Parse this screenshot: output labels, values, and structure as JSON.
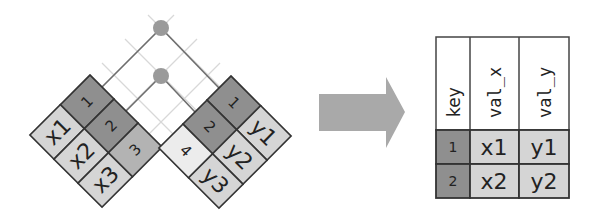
{
  "colors": {
    "key_dark": "#8f8f8f",
    "key_mid": "#b3b3b3",
    "key_light": "#ececec",
    "value": "#d5d5d5",
    "border": "#333333",
    "connector": "#707070",
    "guide": "#d8d8d8",
    "dot": "#9a9a9a",
    "arrow": "#a9a9a9"
  },
  "left_table": {
    "rows": [
      {
        "key": "1",
        "value": "x1",
        "matched": true
      },
      {
        "key": "2",
        "value": "x2",
        "matched": true
      },
      {
        "key": "3",
        "value": "x3",
        "matched": false
      }
    ]
  },
  "right_table": {
    "rows": [
      {
        "key": "1",
        "value": "y1",
        "matched": true
      },
      {
        "key": "2",
        "value": "y2",
        "matched": true
      },
      {
        "key": "4",
        "value": "y3",
        "matched": false
      }
    ]
  },
  "result_table": {
    "headers": [
      "key",
      "val_x",
      "val_y"
    ],
    "rows": [
      [
        "1",
        "x1",
        "y1"
      ],
      [
        "2",
        "x2",
        "y2"
      ]
    ]
  }
}
